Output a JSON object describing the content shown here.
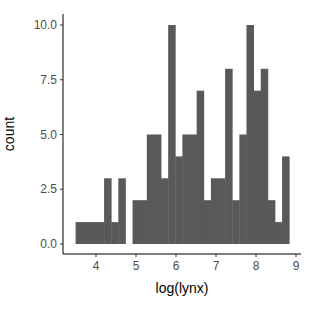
{
  "chart_data": {
    "type": "bar",
    "subtype": "histogram",
    "title": "",
    "xlabel": "log(lynx)",
    "ylabel": "count",
    "bins": 30,
    "bin_start": 3.49,
    "bin_width": 0.178,
    "counts": [
      1,
      1,
      1,
      1,
      3,
      1,
      3,
      0,
      2,
      2,
      5,
      5,
      3,
      10,
      4,
      5,
      5,
      7,
      2,
      3,
      3,
      8,
      2,
      5,
      10,
      7,
      8,
      2,
      1,
      4
    ],
    "xlim": [
      3.2,
      9.1
    ],
    "ylim": [
      -0.5,
      10.5
    ],
    "x_ticks": [
      4,
      5,
      6,
      7,
      8,
      9
    ],
    "x_tick_labels": [
      "4",
      "5",
      "6",
      "7",
      "8",
      "9"
    ],
    "y_ticks": [
      0,
      2.5,
      5,
      7.5,
      10
    ],
    "y_tick_labels": [
      "0.0",
      "2.5",
      "5.0",
      "7.5",
      "10.0"
    ],
    "grid": false,
    "legend": null,
    "bar_color": "#595959",
    "axis_color": "#000000"
  }
}
